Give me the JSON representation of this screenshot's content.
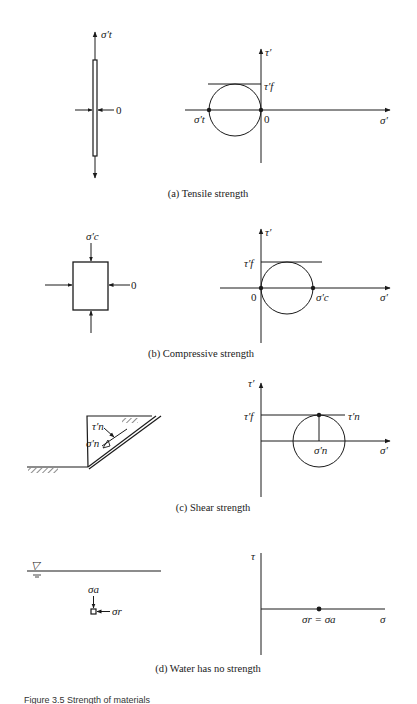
{
  "panels": [
    {
      "id": "a",
      "caption": "(a)  Tensile strength",
      "left": {
        "stress_label": "σ′t",
        "side_label": "0"
      },
      "right": {
        "y_axis": "τ′",
        "x_axis": "σ′",
        "tangent_label": "τ′f",
        "point_left": "σ′t",
        "point_right": "0"
      }
    },
    {
      "id": "b",
      "caption": "(b)  Compressive strength",
      "left": {
        "stress_label": "σ′c",
        "side_label": "0"
      },
      "right": {
        "y_axis": "τ′",
        "x_axis": "σ′",
        "tangent_label": "τ′f",
        "point_left": "0",
        "point_right": "σ′c"
      }
    },
    {
      "id": "c",
      "caption": "(c)  Shear strength",
      "left": {
        "shear_label": "τ′n",
        "normal_label": "σ′n"
      },
      "right": {
        "y_axis": "τ′",
        "x_axis": "σ′",
        "tangent_label": "τ′f",
        "tangent_end_label": "τ′n",
        "point_label": "σ′n"
      }
    },
    {
      "id": "d",
      "caption": "(d)  Water has no strength",
      "left": {
        "water_symbol": "▽",
        "vertical_label": "σa",
        "horizontal_label": "σr"
      },
      "right": {
        "y_axis": "τ",
        "x_axis": "σ",
        "point_label": "σr = σa"
      }
    }
  ],
  "figure_caption": "Figure 3.5  Strength of materials"
}
